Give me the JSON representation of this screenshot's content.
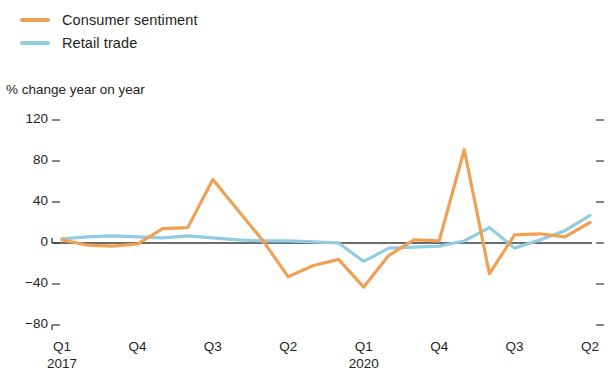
{
  "legend": {
    "items": [
      {
        "label": "Consumer sentiment",
        "color": "#f0a055",
        "name": "consumer-sentiment"
      },
      {
        "label": "Retail trade",
        "color": "#93cbe2",
        "name": "retail-trade"
      }
    ]
  },
  "axis_caption": "% change year on year",
  "chart_data": {
    "type": "line",
    "title": "",
    "subtitle": "",
    "xlabel": "",
    "ylabel": "% change year on year",
    "ylim": [
      -80,
      120
    ],
    "yticks": [
      120,
      80,
      40,
      0,
      -40,
      -80
    ],
    "ytick_labels": [
      "120",
      "80",
      "40",
      "0",
      "−40",
      "−80"
    ],
    "grid": false,
    "zero_line": true,
    "legend_position": "top-left",
    "x": [
      "Q1 2017",
      "Q2 2017",
      "Q3 2017",
      "Q4 2017",
      "Q1 2018",
      "Q2 2018",
      "Q3 2018",
      "Q4 2018",
      "Q1 2019",
      "Q2 2019",
      "Q3 2019",
      "Q4 2019",
      "Q1 2020",
      "Q2 2020",
      "Q3 2020",
      "Q4 2020",
      "Q1 2021",
      "Q2 2021",
      "Q3 2021",
      "Q4 2021",
      "Q1 2022",
      "Q2 2022"
    ],
    "xtick_positions": [
      0,
      3,
      6,
      9,
      12,
      15,
      18,
      21
    ],
    "xtick_labels": [
      "Q1",
      "Q4",
      "Q3",
      "Q2",
      "Q1",
      "Q4",
      "Q3",
      "Q2"
    ],
    "xtick_sublabels": [
      "2017",
      "",
      "",
      "",
      "2020",
      "",
      "",
      ""
    ],
    "series": [
      {
        "name": "Consumer sentiment",
        "color": "#f0a055",
        "values": [
          3,
          -2,
          -3,
          -1,
          14,
          15,
          62,
          32,
          2,
          -33,
          -22,
          -16,
          -43,
          -12,
          3,
          2,
          91,
          -30,
          8,
          9,
          6,
          20
        ]
      },
      {
        "name": "Retail trade",
        "color": "#93cbe2",
        "values": [
          4,
          6,
          7,
          6,
          5,
          7,
          5,
          3,
          2,
          2,
          1,
          0,
          -18,
          -5,
          -4,
          -3,
          2,
          15,
          -5,
          3,
          12,
          27
        ]
      }
    ]
  }
}
